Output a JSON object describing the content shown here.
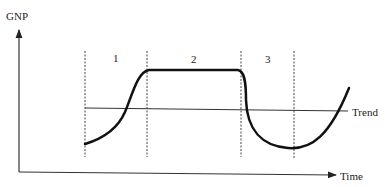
{
  "diagram": {
    "y_axis_label": "GNP",
    "x_axis_label": "Time",
    "trend_label": "Trend",
    "phases": [
      {
        "label": "1"
      },
      {
        "label": "2"
      },
      {
        "label": "3"
      }
    ],
    "colors": {
      "line": "#111111",
      "axis": "#333333",
      "dashed": "#444444",
      "trend": "#333333"
    }
  }
}
